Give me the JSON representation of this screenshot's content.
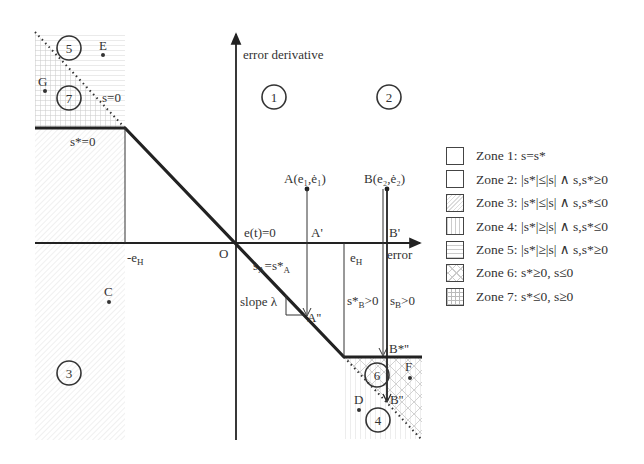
{
  "axes": {
    "y_label": "error derivative",
    "x_label": "error",
    "origin_label": "O",
    "et_zero_label": "e(t)=0"
  },
  "lines": {
    "s_zero_label": "s=0",
    "sstar_zero_label": "s*=0",
    "neg_eh_label": "-e",
    "neg_eh_sub": "H",
    "eh_label": "e",
    "eh_sub": "H",
    "slope_label": "slope λ"
  },
  "points": {
    "A": "A(e₁,ė₁)",
    "A_prime": "A'",
    "A_dprime": "A''",
    "B": "B(e₂,ė₂)",
    "B_prime": "B'",
    "B_star_dprime": "B*''",
    "B_dprime": "B''",
    "C": "C",
    "D": "D",
    "E": "E",
    "F": "F",
    "G": "G"
  },
  "annotations": {
    "sA_eq": "s",
    "sA_sub": "A",
    "sA_rhs": "=s*",
    "sA_rhs_sub": "A",
    "sB_star": "s*",
    "sB_star_sub": "B",
    "sB_star_rhs": ">0",
    "sB": "s",
    "sB_sub": "B",
    "sB_rhs": ">0"
  },
  "zones": [
    {
      "num": "1",
      "label": "Zone 1: s=s*",
      "pattern": "blank"
    },
    {
      "num": "2",
      "label": "Zone 2: |s*|≤|s| ∧ s,s*≥0",
      "pattern": "blank"
    },
    {
      "num": "3",
      "label": "Zone 3: |s*|≤|s| ∧ s,s*≤0",
      "pattern": "diagonal"
    },
    {
      "num": "4",
      "label": "Zone 4: |s*|≥|s| ∧ s,s*≤0",
      "pattern": "vertical"
    },
    {
      "num": "5",
      "label": "Zone 5: |s*|≥|s| ∧ s,s*≥0",
      "pattern": "horizontal"
    },
    {
      "num": "6",
      "label": "Zone 6: s*≥0, s≤0",
      "pattern": "crosshatch"
    },
    {
      "num": "7",
      "label": "Zone 7: s*≤0, s≥0",
      "pattern": "grid"
    }
  ],
  "colors": {
    "ink": "#222222",
    "hatch": "#cccccc",
    "background": "#ffffff"
  }
}
